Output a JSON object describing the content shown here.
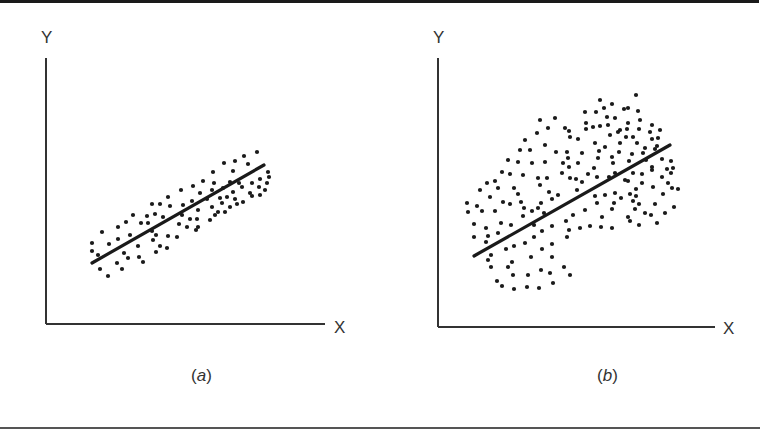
{
  "figure": {
    "panels": [
      {
        "id": "a",
        "caption_letter": "a",
        "x_label": "X",
        "y_label": "Y"
      },
      {
        "id": "b",
        "caption_letter": "b",
        "x_label": "X",
        "y_label": "Y"
      }
    ]
  },
  "colors": {
    "ink": "#1a1a1a",
    "axis": "#333333",
    "background": "#ffffff"
  },
  "chart_data": [
    {
      "type": "scatter",
      "title": "(a)",
      "xlabel": "X",
      "ylabel": "Y",
      "grid": false,
      "description": "Tight positive linear correlation with fitted regression line",
      "regression_line": {
        "x1": 92,
        "y1": 263,
        "x2": 264,
        "y2": 165
      },
      "axes": {
        "origin": [
          46,
          324
        ],
        "y_top": 58,
        "x_right": 325
      },
      "points_px": [
        [
          102,
          232
        ],
        [
          92,
          243
        ],
        [
          92,
          251
        ],
        [
          109,
          244
        ],
        [
          118,
          227
        ],
        [
          118,
          239
        ],
        [
          126,
          222
        ],
        [
          130,
          235
        ],
        [
          133,
          215
        ],
        [
          141,
          223
        ],
        [
          147,
          216
        ],
        [
          148,
          223
        ],
        [
          152,
          204
        ],
        [
          155,
          214
        ],
        [
          160,
          204
        ],
        [
          168,
          197
        ],
        [
          170,
          206
        ],
        [
          181,
          190
        ],
        [
          100,
          269
        ],
        [
          108,
          276
        ],
        [
          117,
          263
        ],
        [
          122,
          269
        ],
        [
          98,
          255
        ],
        [
          124,
          253
        ],
        [
          128,
          258
        ],
        [
          138,
          246
        ],
        [
          139,
          257
        ],
        [
          143,
          262
        ],
        [
          153,
          240
        ],
        [
          156,
          235
        ],
        [
          160,
          246
        ],
        [
          167,
          248
        ],
        [
          156,
          252
        ],
        [
          168,
          236
        ],
        [
          177,
          237
        ],
        [
          179,
          224
        ],
        [
          152,
          231
        ],
        [
          163,
          217
        ],
        [
          257,
          152
        ],
        [
          244,
          156
        ],
        [
          235,
          161
        ],
        [
          248,
          164
        ],
        [
          224,
          163
        ],
        [
          213,
          172
        ],
        [
          233,
          171
        ],
        [
          203,
          181
        ],
        [
          193,
          186
        ],
        [
          214,
          183
        ],
        [
          230,
          182
        ],
        [
          239,
          183
        ],
        [
          252,
          183
        ],
        [
          260,
          179
        ],
        [
          268,
          172
        ],
        [
          269,
          177
        ],
        [
          267,
          183
        ],
        [
          259,
          187
        ],
        [
          265,
          190
        ],
        [
          250,
          193
        ],
        [
          242,
          187
        ],
        [
          233,
          192
        ],
        [
          223,
          188
        ],
        [
          212,
          190
        ],
        [
          200,
          193
        ],
        [
          192,
          201
        ],
        [
          207,
          199
        ],
        [
          220,
          198
        ],
        [
          227,
          197
        ],
        [
          235,
          199
        ],
        [
          243,
          202
        ],
        [
          252,
          196
        ],
        [
          260,
          195
        ],
        [
          183,
          205
        ],
        [
          198,
          210
        ],
        [
          212,
          207
        ],
        [
          222,
          203
        ],
        [
          230,
          207
        ],
        [
          237,
          204
        ],
        [
          218,
          212
        ],
        [
          225,
          212
        ],
        [
          190,
          219
        ],
        [
          197,
          219
        ],
        [
          210,
          220
        ],
        [
          215,
          215
        ],
        [
          196,
          230
        ],
        [
          198,
          227
        ],
        [
          182,
          215
        ],
        [
          187,
          227
        ]
      ]
    },
    {
      "type": "scatter",
      "title": "(b)",
      "xlabel": "X",
      "ylabel": "Y",
      "grid": false,
      "description": "Weak positive correlation, wide elliptical scatter with fitted regression line",
      "regression_line": {
        "x1": 474,
        "y1": 256,
        "x2": 670,
        "y2": 145
      },
      "axes": {
        "origin": [
          438,
          327
        ],
        "y_top": 58,
        "x_right": 715
      },
      "points_px": [
        [
          467,
          203
        ],
        [
          468,
          212
        ],
        [
          477,
          206
        ],
        [
          480,
          190
        ],
        [
          487,
          183
        ],
        [
          495,
          181
        ],
        [
          490,
          197
        ],
        [
          498,
          188
        ],
        [
          482,
          211
        ],
        [
          495,
          211
        ],
        [
          503,
          202
        ],
        [
          510,
          204
        ],
        [
          514,
          188
        ],
        [
          518,
          194
        ],
        [
          521,
          202
        ],
        [
          524,
          208
        ],
        [
          502,
          172
        ],
        [
          510,
          174
        ],
        [
          523,
          175
        ],
        [
          518,
          162
        ],
        [
          532,
          163
        ],
        [
          545,
          162
        ],
        [
          538,
          178
        ],
        [
          547,
          178
        ],
        [
          540,
          185
        ],
        [
          549,
          192
        ],
        [
          558,
          195
        ],
        [
          552,
          199
        ],
        [
          541,
          203
        ],
        [
          532,
          211
        ],
        [
          538,
          208
        ],
        [
          544,
          213
        ],
        [
          523,
          216
        ],
        [
          562,
          173
        ],
        [
          563,
          163
        ],
        [
          570,
          178
        ],
        [
          474,
          224
        ],
        [
          474,
          237
        ],
        [
          486,
          228
        ],
        [
          488,
          236
        ],
        [
          486,
          242
        ],
        [
          501,
          223
        ],
        [
          511,
          225
        ],
        [
          498,
          233
        ],
        [
          534,
          225
        ],
        [
          542,
          231
        ],
        [
          552,
          226
        ],
        [
          566,
          221
        ],
        [
          569,
          230
        ],
        [
          534,
          237
        ],
        [
          525,
          243
        ],
        [
          514,
          246
        ],
        [
          506,
          249
        ],
        [
          542,
          249
        ],
        [
          552,
          244
        ],
        [
          567,
          237
        ],
        [
          491,
          255
        ],
        [
          488,
          260
        ],
        [
          491,
          267
        ],
        [
          508,
          267
        ],
        [
          512,
          262
        ],
        [
          531,
          257
        ],
        [
          552,
          257
        ],
        [
          564,
          267
        ],
        [
          541,
          270
        ],
        [
          528,
          275
        ],
        [
          513,
          275
        ],
        [
          550,
          273
        ],
        [
          570,
          275
        ],
        [
          497,
          281
        ],
        [
          502,
          286
        ],
        [
          514,
          289
        ],
        [
          527,
          287
        ],
        [
          539,
          288
        ],
        [
          553,
          283
        ],
        [
          624,
          109
        ],
        [
          638,
          111
        ],
        [
          607,
          117
        ],
        [
          615,
          118
        ],
        [
          586,
          123
        ],
        [
          593,
          127
        ],
        [
          600,
          126
        ],
        [
          608,
          125
        ],
        [
          586,
          129
        ],
        [
          628,
          123
        ],
        [
          640,
          120
        ],
        [
          652,
          125
        ],
        [
          618,
          132
        ],
        [
          627,
          129
        ],
        [
          639,
          129
        ],
        [
          650,
          132
        ],
        [
          610,
          135
        ],
        [
          626,
          137
        ],
        [
          633,
          137
        ],
        [
          652,
          139
        ],
        [
          658,
          138
        ],
        [
          569,
          131
        ],
        [
          570,
          137
        ],
        [
          578,
          139
        ],
        [
          595,
          143
        ],
        [
          605,
          147
        ],
        [
          620,
          143
        ],
        [
          637,
          143
        ],
        [
          645,
          148
        ],
        [
          657,
          146
        ],
        [
          567,
          152
        ],
        [
          582,
          153
        ],
        [
          599,
          151
        ],
        [
          619,
          152
        ],
        [
          632,
          154
        ],
        [
          643,
          153
        ],
        [
          655,
          149
        ],
        [
          568,
          158
        ],
        [
          598,
          158
        ],
        [
          612,
          157
        ],
        [
          629,
          161
        ],
        [
          646,
          160
        ],
        [
          662,
          159
        ],
        [
          671,
          161
        ],
        [
          578,
          163
        ],
        [
          569,
          167
        ],
        [
          594,
          168
        ],
        [
          613,
          163
        ],
        [
          652,
          167
        ],
        [
          667,
          169
        ],
        [
          673,
          168
        ],
        [
          652,
          170
        ],
        [
          588,
          174
        ],
        [
          597,
          177
        ],
        [
          609,
          177
        ],
        [
          615,
          173
        ],
        [
          625,
          180
        ],
        [
          633,
          173
        ],
        [
          642,
          174
        ],
        [
          662,
          177
        ],
        [
          671,
          173
        ],
        [
          576,
          179
        ],
        [
          582,
          182
        ],
        [
          628,
          181
        ],
        [
          642,
          183
        ],
        [
          668,
          183
        ],
        [
          672,
          188
        ],
        [
          678,
          189
        ],
        [
          577,
          190
        ],
        [
          636,
          189
        ],
        [
          653,
          187
        ],
        [
          595,
          196
        ],
        [
          605,
          195
        ],
        [
          615,
          193
        ],
        [
          630,
          194
        ],
        [
          636,
          196
        ],
        [
          663,
          194
        ],
        [
          621,
          198
        ],
        [
          597,
          203
        ],
        [
          614,
          203
        ],
        [
          633,
          201
        ],
        [
          639,
          204
        ],
        [
          655,
          204
        ],
        [
          674,
          207
        ],
        [
          585,
          210
        ],
        [
          612,
          209
        ],
        [
          635,
          209
        ],
        [
          645,
          213
        ],
        [
          651,
          215
        ],
        [
          665,
          213
        ],
        [
          573,
          215
        ],
        [
          602,
          217
        ],
        [
          628,
          217
        ],
        [
          630,
          221
        ],
        [
          657,
          223
        ],
        [
          580,
          228
        ],
        [
          590,
          226
        ],
        [
          601,
          227
        ],
        [
          612,
          228
        ],
        [
          639,
          225
        ],
        [
          525,
          140
        ],
        [
          545,
          145
        ],
        [
          556,
          152
        ],
        [
          530,
          150
        ],
        [
          548,
          128
        ],
        [
          537,
          133
        ],
        [
          520,
          150
        ],
        [
          508,
          160
        ],
        [
          540,
          120
        ],
        [
          555,
          118
        ],
        [
          565,
          128
        ],
        [
          585,
          112
        ],
        [
          596,
          112
        ],
        [
          604,
          108
        ],
        [
          612,
          104
        ],
        [
          628,
          108
        ],
        [
          600,
          100
        ],
        [
          636,
          95
        ],
        [
          620,
          130
        ],
        [
          660,
          130
        ]
      ]
    }
  ]
}
